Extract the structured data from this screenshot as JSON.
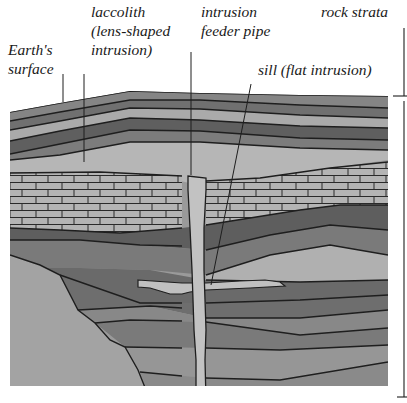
{
  "diagram": {
    "labels": {
      "earths_surface": [
        "Earth's",
        "surface"
      ],
      "laccolith": [
        "laccolith",
        "(lens-shaped",
        "intrusion)"
      ],
      "feeder_pipe": [
        "intrusion",
        "feeder pipe"
      ],
      "sill": "sill (flat intrusion)",
      "rock_strata": "rock strata"
    },
    "colors": {
      "dark_layer": "#6e6e6e",
      "mid_layer": "#8c8c8c",
      "light_layer": "#b2b2b2",
      "intrusion": "#bdbdbd",
      "outline": "#1e1e1e",
      "background": "#ffffff"
    }
  }
}
